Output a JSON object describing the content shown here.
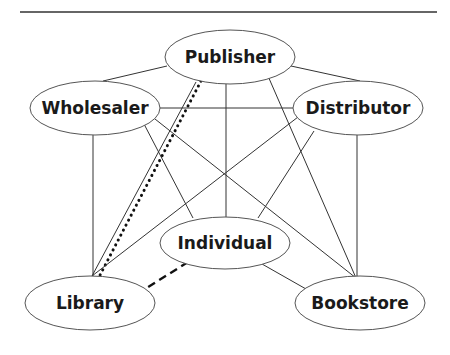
{
  "diagram": {
    "title": "",
    "nodes": [
      {
        "id": "publisher",
        "label": "Publisher",
        "cx": 230,
        "cy": 57,
        "rx": 65,
        "ry": 27
      },
      {
        "id": "wholesaler",
        "label": "Wholesaler",
        "cx": 95,
        "cy": 108,
        "rx": 65,
        "ry": 27
      },
      {
        "id": "distributor",
        "label": "Distributor",
        "cx": 358,
        "cy": 108,
        "rx": 65,
        "ry": 27
      },
      {
        "id": "individual",
        "label": "Individual",
        "cx": 225,
        "cy": 243,
        "rx": 65,
        "ry": 26
      },
      {
        "id": "library",
        "label": "Library",
        "cx": 90,
        "cy": 303,
        "rx": 65,
        "ry": 27
      },
      {
        "id": "bookstore",
        "label": "Bookstore",
        "cx": 360,
        "cy": 303,
        "rx": 65,
        "ry": 27
      }
    ],
    "edges": [
      {
        "from": "publisher",
        "to": "wholesaler",
        "style": "solid"
      },
      {
        "from": "publisher",
        "to": "distributor",
        "style": "solid"
      },
      {
        "from": "publisher",
        "to": "individual",
        "style": "solid"
      },
      {
        "from": "publisher",
        "to": "bookstore",
        "style": "solid"
      },
      {
        "from": "publisher",
        "to": "library",
        "style": "solid"
      },
      {
        "from": "publisher",
        "to": "library",
        "style": "dotted"
      },
      {
        "from": "wholesaler",
        "to": "distributor",
        "style": "solid"
      },
      {
        "from": "wholesaler",
        "to": "library",
        "style": "solid"
      },
      {
        "from": "wholesaler",
        "to": "individual",
        "style": "solid"
      },
      {
        "from": "wholesaler",
        "to": "bookstore",
        "style": "solid"
      },
      {
        "from": "distributor",
        "to": "library",
        "style": "solid"
      },
      {
        "from": "distributor",
        "to": "individual",
        "style": "solid"
      },
      {
        "from": "distributor",
        "to": "bookstore",
        "style": "solid"
      },
      {
        "from": "individual",
        "to": "bookstore",
        "style": "solid"
      },
      {
        "from": "individual",
        "to": "library",
        "style": "dashed"
      }
    ]
  }
}
